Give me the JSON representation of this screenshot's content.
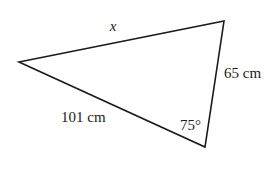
{
  "figure": {
    "type": "triangle-diagram",
    "background_color": "#ffffff",
    "stroke_color": "#1b1b1b",
    "text_color": "#1b1b1b",
    "vertices": {
      "left": {
        "x": 19,
        "y": 62
      },
      "top_right": {
        "x": 224,
        "y": 21
      },
      "bottom_right": {
        "x": 205,
        "y": 147
      }
    },
    "labels": {
      "top_side": {
        "text": "x",
        "style": "italic",
        "x": 113,
        "y": 31
      },
      "right_side": {
        "text": "65 cm",
        "style": "normal",
        "x": 224,
        "y": 78
      },
      "bottom_side": {
        "text": "101 cm",
        "style": "normal",
        "x": 61,
        "y": 122
      },
      "angle_bottom_right": {
        "text": "75°",
        "style": "normal",
        "x": 180,
        "y": 130
      }
    }
  }
}
